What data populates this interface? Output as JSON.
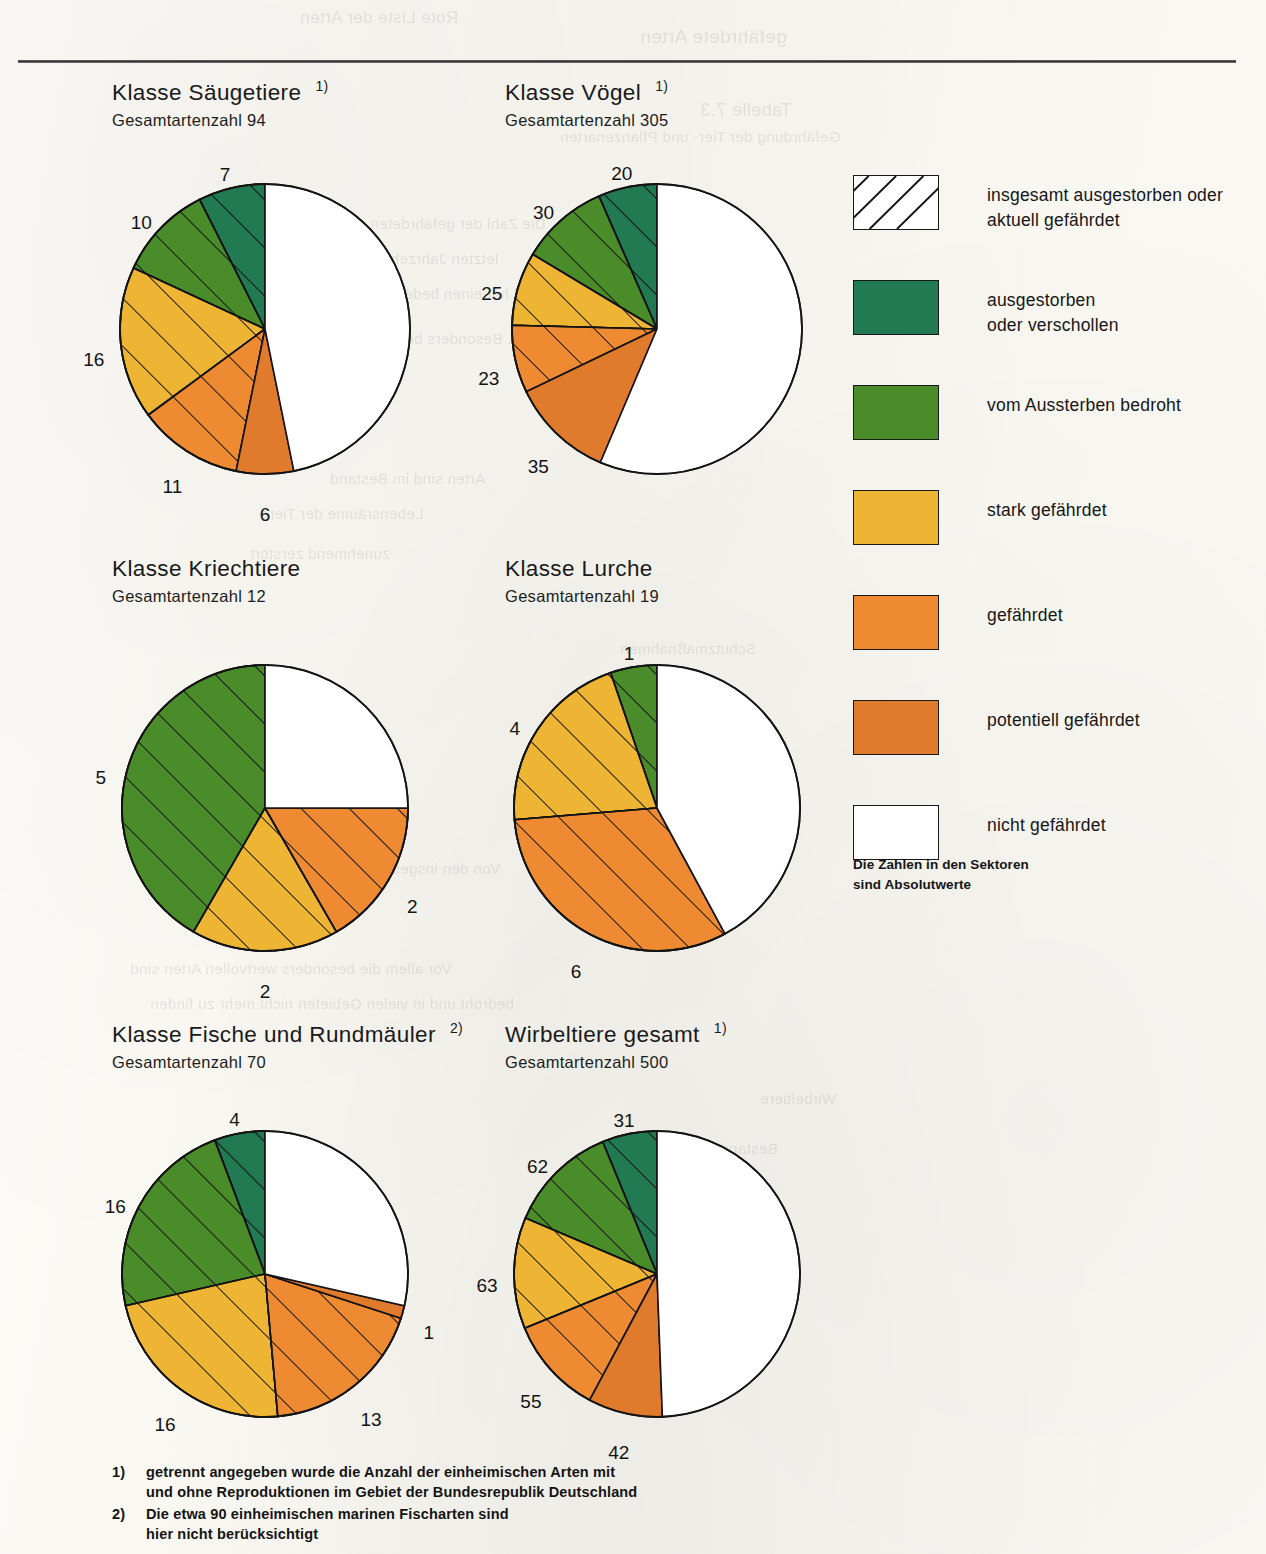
{
  "page": {
    "bleed_through_lines": [
      {
        "x": 300,
        "y": 8,
        "size": 17,
        "text": "Rote Liste der Arten"
      },
      {
        "x": 640,
        "y": 26,
        "size": 19,
        "text": "gefährdete Arten"
      },
      {
        "x": 700,
        "y": 100,
        "size": 18,
        "text": "Tabelle 7.3"
      },
      {
        "x": 560,
        "y": 128,
        "size": 15,
        "text": "Gefährdung der Tier- und Pflanzenarten"
      },
      {
        "x": 260,
        "y": 215,
        "size": 15,
        "text": "Die Zahl der gefährdeten Arten ist in den"
      },
      {
        "x": 230,
        "y": 250,
        "size": 15,
        "text": "letzten Jahrzehnten stark angestiegen"
      },
      {
        "x": 300,
        "y": 285,
        "size": 15,
        "text": "und hat einen bedenklichen Stand"
      },
      {
        "x": 360,
        "y": 330,
        "size": 15,
        "text": "erreicht. Besonders betroffen"
      },
      {
        "x": 330,
        "y": 470,
        "size": 15,
        "text": "Arten sind im Bestand"
      },
      {
        "x": 260,
        "y": 505,
        "size": 15,
        "text": "Lebensräume der Tiere"
      },
      {
        "x": 250,
        "y": 545,
        "size": 15,
        "text": "zunehmend zerstört"
      },
      {
        "x": 620,
        "y": 640,
        "size": 15,
        "text": "Schutzmaßnahmen"
      },
      {
        "x": 640,
        "y": 680,
        "size": 15,
        "text": "notwendig"
      },
      {
        "x": 680,
        "y": 790,
        "size": 15,
        "text": "Wirbeltiere"
      },
      {
        "x": 150,
        "y": 860,
        "size": 15,
        "text": "Von den insgesamt 500 Arten sind etwa die Hälfte"
      },
      {
        "x": 180,
        "y": 895,
        "size": 15,
        "text": "in ihrem Bestand gefährdet"
      },
      {
        "x": 130,
        "y": 960,
        "size": 15,
        "text": "Vor allem die besonders wertvollen Arten sind"
      },
      {
        "x": 150,
        "y": 995,
        "size": 15,
        "text": "bedroht und in vielen Gebieten nicht mehr zu finden"
      },
      {
        "x": 760,
        "y": 1090,
        "size": 15,
        "text": "Wirbeltiere"
      },
      {
        "x": 720,
        "y": 1140,
        "size": 15,
        "text": "Bestand"
      }
    ]
  },
  "legend": {
    "items": [
      {
        "swatch": "hatched-white",
        "color": "#ffffff",
        "hatched": true,
        "label": "insgesamt ausgestorben oder\naktuell gefährdet",
        "name": "legend-total-endangered"
      },
      {
        "swatch": "solid",
        "color": "#217a52",
        "hatched": false,
        "label": "ausgestorben\noder verschollen",
        "name": "legend-extinct"
      },
      {
        "swatch": "solid",
        "color": "#4a8c2a",
        "hatched": false,
        "label": "vom Aussterben bedroht",
        "name": "legend-threatened-extinction"
      },
      {
        "swatch": "solid",
        "color": "#eeb434",
        "hatched": false,
        "label": "stark gefährdet",
        "name": "legend-strongly-endangered"
      },
      {
        "swatch": "solid",
        "color": "#ee8b32",
        "hatched": false,
        "label": "gefährdet",
        "name": "legend-endangered"
      },
      {
        "swatch": "solid",
        "color": "#e07a2c",
        "hatched": false,
        "label": "potentiell gefährdet",
        "name": "legend-potentially-endangered"
      },
      {
        "swatch": "solid",
        "color": "#ffffff",
        "hatched": false,
        "label": "nicht gefährdet",
        "name": "legend-not-endangered"
      }
    ],
    "note": "Die Zahlen in den Sektoren\nsind Absolutwerte"
  },
  "footnotes": [
    {
      "mark": "1)",
      "text": "getrennt angegeben wurde die Anzahl der einheimischen Arten mit\nund ohne Reproduktionen im Gebiet der Bundesrepublik Deutschland"
    },
    {
      "mark": "2)",
      "text": "Die etwa 90 einheimischen marinen Fischarten sind\nhier nicht berücksichtigt"
    }
  ],
  "chart_data": [
    {
      "type": "pie",
      "id": "saeugetiere",
      "title": "Klasse Säugetiere",
      "superscript": "1)",
      "subtitle": "Gesamtartenzahl 94",
      "total": 94,
      "categories": [
        "ausgestorben oder verschollen",
        "vom Aussterben bedroht",
        "stark gefährdet",
        "gefährdet",
        "potentiell gefährdet",
        "nicht gefährdet"
      ],
      "values": [
        7,
        10,
        16,
        11,
        6,
        44
      ],
      "colors": [
        "#217a52",
        "#4a8c2a",
        "#eeb434",
        "#ee8b32",
        "#e07a2c",
        "#ffffff"
      ],
      "hatched": [
        true,
        true,
        true,
        true,
        false,
        false
      ],
      "labels": [
        "7",
        "10",
        "16",
        "11",
        "6",
        ""
      ]
    },
    {
      "type": "pie",
      "id": "voegel",
      "title": "Klasse Vögel",
      "superscript": "1)",
      "subtitle": "Gesamtartenzahl 305",
      "total": 305,
      "categories": [
        "ausgestorben oder verschollen",
        "vom Aussterben bedroht",
        "stark gefährdet",
        "gefährdet",
        "potentiell gefährdet",
        "nicht gefährdet"
      ],
      "values": [
        20,
        30,
        25,
        23,
        35,
        172
      ],
      "colors": [
        "#217a52",
        "#4a8c2a",
        "#eeb434",
        "#ee8b32",
        "#e07a2c",
        "#ffffff"
      ],
      "hatched": [
        true,
        true,
        true,
        true,
        false,
        false
      ],
      "labels": [
        "20",
        "30",
        "25",
        "23",
        "35",
        ""
      ]
    },
    {
      "type": "pie",
      "id": "kriechtiere",
      "title": "Klasse Kriechtiere",
      "superscript": "",
      "subtitle": "Gesamtartenzahl 12",
      "total": 12,
      "categories": [
        "ausgestorben oder verschollen",
        "vom Aussterben bedroht",
        "stark gefährdet",
        "gefährdet",
        "potentiell gefährdet",
        "nicht gefährdet"
      ],
      "values": [
        0,
        5,
        2,
        2,
        0,
        3
      ],
      "colors": [
        "#217a52",
        "#4a8c2a",
        "#eeb434",
        "#ee8b32",
        "#e07a2c",
        "#ffffff"
      ],
      "hatched": [
        true,
        true,
        true,
        true,
        false,
        false
      ],
      "labels": [
        "",
        "5",
        "2",
        "2",
        "",
        ""
      ]
    },
    {
      "type": "pie",
      "id": "lurche",
      "title": "Klasse Lurche",
      "superscript": "",
      "subtitle": "Gesamtartenzahl 19",
      "total": 19,
      "categories": [
        "ausgestorben oder verschollen",
        "vom Aussterben bedroht",
        "stark gefährdet",
        "gefährdet",
        "potentiell gefährdet",
        "nicht gefährdet"
      ],
      "values": [
        0,
        1,
        4,
        6,
        0,
        8
      ],
      "colors": [
        "#217a52",
        "#4a8c2a",
        "#eeb434",
        "#ee8b32",
        "#e07a2c",
        "#ffffff"
      ],
      "hatched": [
        true,
        true,
        true,
        true,
        false,
        false
      ],
      "labels": [
        "",
        "1",
        "4",
        "6",
        "",
        ""
      ]
    },
    {
      "type": "pie",
      "id": "fische",
      "title": "Klasse Fische und Rundmäuler",
      "superscript": "2)",
      "subtitle": "Gesamtartenzahl 70",
      "total": 70,
      "categories": [
        "ausgestorben oder verschollen",
        "vom Aussterben bedroht",
        "stark gefährdet",
        "gefährdet",
        "potentiell gefährdet",
        "nicht gefährdet"
      ],
      "values": [
        4,
        16,
        16,
        13,
        1,
        20
      ],
      "colors": [
        "#217a52",
        "#4a8c2a",
        "#eeb434",
        "#ee8b32",
        "#e07a2c",
        "#ffffff"
      ],
      "hatched": [
        true,
        true,
        true,
        true,
        false,
        false
      ],
      "labels": [
        "4",
        "16",
        "16",
        "13",
        "1",
        ""
      ]
    },
    {
      "type": "pie",
      "id": "wirbeltiere",
      "title": "Wirbeltiere gesamt",
      "superscript": "1)",
      "subtitle": "Gesamtartenzahl 500",
      "total": 500,
      "categories": [
        "ausgestorben oder verschollen",
        "vom Aussterben bedroht",
        "stark gefährdet",
        "gefährdet",
        "potentiell gefährdet",
        "nicht gefährdet"
      ],
      "values": [
        31,
        62,
        63,
        55,
        42,
        247
      ],
      "colors": [
        "#217a52",
        "#4a8c2a",
        "#eeb434",
        "#ee8b32",
        "#e07a2c",
        "#ffffff"
      ],
      "hatched": [
        true,
        true,
        true,
        true,
        false,
        false
      ],
      "labels": [
        "31",
        "62",
        "63",
        "55",
        "42",
        ""
      ]
    }
  ],
  "chart_layout": [
    {
      "id": "saeugetiere",
      "left": 112,
      "top": 78,
      "cx": 153,
      "cy": 185,
      "r": 145,
      "label_r": 172
    },
    {
      "id": "voegel",
      "left": 505,
      "top": 78,
      "cx": 152,
      "cy": 185,
      "r": 145,
      "label_r": 172
    },
    {
      "id": "kriechtiere",
      "left": 112,
      "top": 556,
      "cx": 153,
      "cy": 188,
      "r": 143,
      "label_r": 170
    },
    {
      "id": "lurche",
      "left": 505,
      "top": 556,
      "cx": 152,
      "cy": 188,
      "r": 143,
      "label_r": 170
    },
    {
      "id": "fische",
      "left": 112,
      "top": 1020,
      "cx": 153,
      "cy": 188,
      "r": 143,
      "label_r": 170
    },
    {
      "id": "wirbeltiere",
      "left": 505,
      "top": 1020,
      "cx": 152,
      "cy": 188,
      "r": 143,
      "label_r": 170
    }
  ]
}
